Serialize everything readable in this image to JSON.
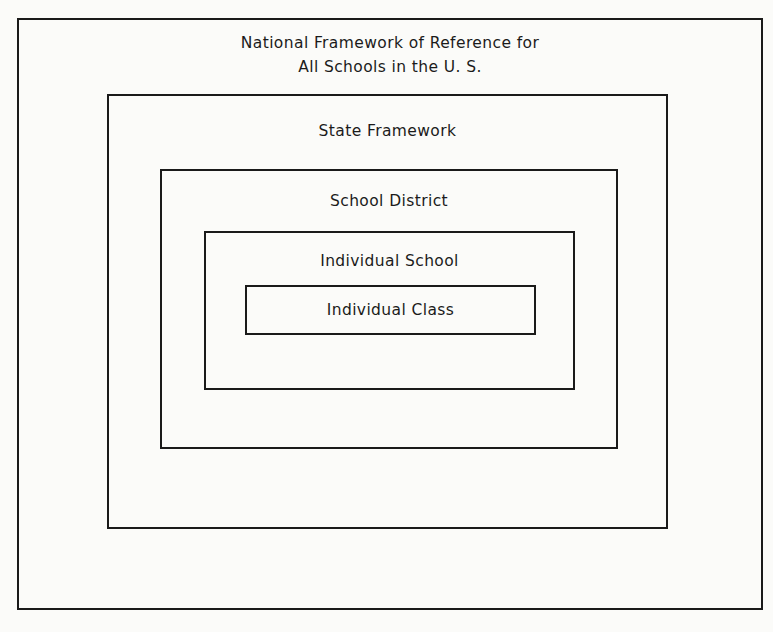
{
  "diagram": {
    "type": "nested-boxes",
    "levels": [
      {
        "label_line1": "National Framework of Reference for",
        "label_line2": "All Schools in the U. S."
      },
      {
        "label": "State Framework"
      },
      {
        "label": "School District"
      },
      {
        "label": "Individual School"
      },
      {
        "label": "Individual Class"
      }
    ]
  }
}
